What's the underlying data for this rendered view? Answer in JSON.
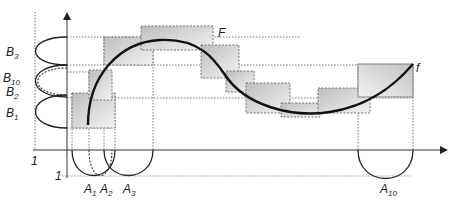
{
  "diagram": {
    "type": "fuzzy-relation-approximation",
    "curve_labels": {
      "fuzzy_graph": "F",
      "function": "f"
    },
    "x_axis": {
      "membership_label": "1",
      "fuzzy_sets": [
        {
          "name": "A",
          "sub": "1"
        },
        {
          "name": "A",
          "sub": "2"
        },
        {
          "name": "A",
          "sub": "3"
        },
        {
          "name": "A",
          "sub": "10"
        }
      ]
    },
    "y_axis": {
      "membership_label": "1",
      "fuzzy_sets": [
        {
          "name": "B",
          "sub": "3"
        },
        {
          "name": "B",
          "sub": "10"
        },
        {
          "name": "B",
          "sub": "2"
        },
        {
          "name": "B",
          "sub": "1"
        }
      ]
    },
    "colors": {
      "curve": "#111111",
      "box_fill": "#d6d6d6",
      "grid": "#555555"
    }
  }
}
